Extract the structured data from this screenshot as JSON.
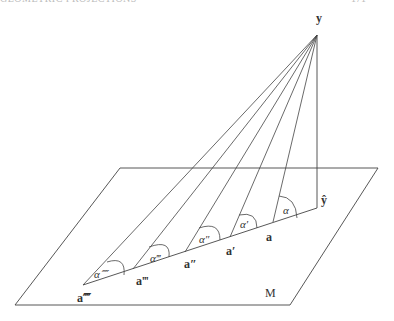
{
  "header": {
    "left_text": "GEOMETRIC PROJECTIONS",
    "right_text": "171"
  },
  "diagram": {
    "apex_label": "y",
    "projection_label": "ŷ",
    "plane_label": "M",
    "points": [
      {
        "label": "a",
        "angle": "α"
      },
      {
        "label": "a′",
        "angle": "α′"
      },
      {
        "label": "a″",
        "angle": "α″"
      },
      {
        "label": "a‴",
        "angle": "α‴"
      },
      {
        "label": "a⁗",
        "angle": "α⁗"
      }
    ],
    "stroke_color": "#333333"
  }
}
